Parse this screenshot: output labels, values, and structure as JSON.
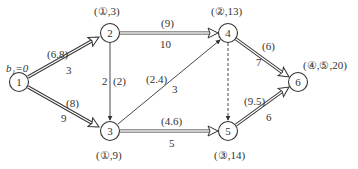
{
  "diagram": {
    "title": "",
    "start_label": "b₁=0",
    "nodes": [
      {
        "id": "1",
        "x": 19,
        "y": 82,
        "label": "1",
        "annotation": ""
      },
      {
        "id": "2",
        "x": 110,
        "y": 33,
        "label": "2",
        "annotation": "(①,3)"
      },
      {
        "id": "3",
        "x": 110,
        "y": 131,
        "label": "3",
        "annotation": "(①,9)"
      },
      {
        "id": "4",
        "x": 228,
        "y": 33,
        "label": "4",
        "annotation": "(②,13)"
      },
      {
        "id": "5",
        "x": 228,
        "y": 131,
        "label": "5",
        "annotation": "(③,14)"
      },
      {
        "id": "6",
        "x": 298,
        "y": 82,
        "label": "6",
        "annotation": "(④,⑤,20)"
      }
    ],
    "edges": [
      {
        "from": "1",
        "to": "2",
        "weight": "3",
        "paren": "(6.8)",
        "style": "double"
      },
      {
        "from": "1",
        "to": "3",
        "weight": "9",
        "paren": "(8)",
        "style": "double"
      },
      {
        "from": "2",
        "to": "4",
        "weight": "10",
        "paren": "(9)",
        "style": "double"
      },
      {
        "from": "2",
        "to": "3",
        "weight": "2",
        "paren": "(2)",
        "style": "single"
      },
      {
        "from": "3",
        "to": "4",
        "weight": "3",
        "paren": "(2.4)",
        "style": "single"
      },
      {
        "from": "3",
        "to": "5",
        "weight": "5",
        "paren": "(4.6)",
        "style": "double"
      },
      {
        "from": "4",
        "to": "5",
        "weight": "",
        "paren": "",
        "style": "dashed"
      },
      {
        "from": "4",
        "to": "6",
        "weight": "7",
        "paren": "(6)",
        "style": "double"
      },
      {
        "from": "5",
        "to": "6",
        "weight": "6",
        "paren": "(9.5)",
        "style": "double"
      }
    ],
    "colors": {
      "line": "#333333",
      "background": "#ffffff"
    }
  }
}
